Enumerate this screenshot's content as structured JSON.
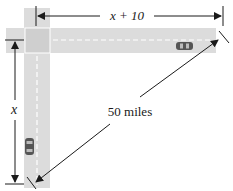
{
  "diagram": {
    "labels": {
      "horizontal_distance": "x + 10",
      "vertical_distance": "x",
      "hypotenuse_distance": "50 miles"
    },
    "colors": {
      "road": "#d9d9d9",
      "intersection": "#cfcfcf",
      "lane_marking": "#ffffff",
      "car": "#555555",
      "ink": "#1a1a1a",
      "background": "#ffffff"
    },
    "elements": {
      "horizontal_road": "east-west road",
      "vertical_road": "north-south road",
      "intersection": "intersection square",
      "car_east": "car on horizontal road",
      "car_south": "car on vertical road"
    }
  }
}
